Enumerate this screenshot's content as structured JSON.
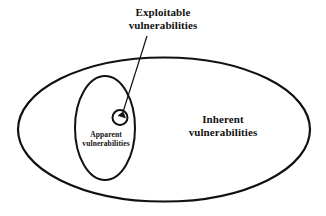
{
  "figure": {
    "type": "venn-ellipse-diagram",
    "background_color": "#ffffff",
    "stroke_color": "#111111"
  },
  "labels": {
    "exploitable": {
      "line1": "Exploitable",
      "line2": "vulnerabilities"
    },
    "inherent": {
      "line1": "Inherent",
      "line2": "vulnerabilities"
    },
    "apparent": {
      "line1": "Apparent",
      "line2": "vulnerabilities"
    }
  },
  "shapes": {
    "outer_ellipse_name": "inherent-vulnerabilities-region",
    "inner_ellipse_name": "apparent-vulnerabilities-region",
    "small_circle_name": "exploitable-vulnerabilities-region",
    "leader_line_name": "exploitable-callout-line"
  }
}
